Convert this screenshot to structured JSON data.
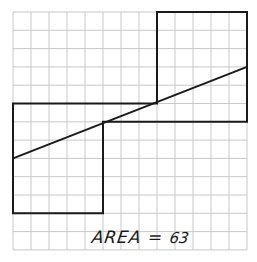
{
  "diagram": {
    "grid": {
      "columns": 13,
      "rows": 13,
      "origin_px": [
        13,
        12
      ],
      "cell_w_px": 18,
      "cell_h_px": 18.3,
      "line_color": "#c8c8c8"
    },
    "shape": {
      "stroke_color": "#1a1a1a",
      "outline_grid_points": [
        [
          0,
          5
        ],
        [
          8,
          5
        ],
        [
          8,
          0
        ],
        [
          13,
          0
        ],
        [
          13,
          6
        ],
        [
          5,
          6
        ],
        [
          5,
          11
        ],
        [
          0,
          11
        ]
      ],
      "diagonal_grid_points": [
        [
          0,
          8
        ],
        [
          13,
          3
        ]
      ]
    },
    "label": {
      "text_prefix": "AREA =",
      "value": "63"
    }
  }
}
